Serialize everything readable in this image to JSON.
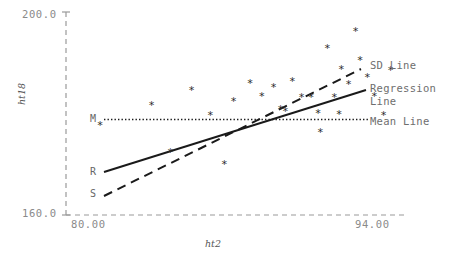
{
  "chart_data": {
    "type": "scatter",
    "title": "",
    "xlabel": "ht2",
    "ylabel": "ht18",
    "xlim": [
      80.0,
      94.0
    ],
    "ylim": [
      160.0,
      200.0
    ],
    "xticks": [
      "80.00",
      "94.00"
    ],
    "yticks": [
      "160.0",
      "200.0"
    ],
    "grid": false,
    "legend_position": "right",
    "points": [
      {
        "x": 81.2,
        "y": 177.5
      },
      {
        "x": 83.4,
        "y": 181.4
      },
      {
        "x": 84.2,
        "y": 172.3
      },
      {
        "x": 85.1,
        "y": 184.5
      },
      {
        "x": 85.9,
        "y": 179.6
      },
      {
        "x": 86.5,
        "y": 169.8
      },
      {
        "x": 86.9,
        "y": 182.2
      },
      {
        "x": 87.6,
        "y": 185.8
      },
      {
        "x": 88.1,
        "y": 183.3
      },
      {
        "x": 88.6,
        "y": 185.0
      },
      {
        "x": 88.9,
        "y": 180.6
      },
      {
        "x": 89.1,
        "y": 180.3
      },
      {
        "x": 89.4,
        "y": 186.2
      },
      {
        "x": 89.8,
        "y": 183.1
      },
      {
        "x": 90.2,
        "y": 183.0
      },
      {
        "x": 90.5,
        "y": 179.9
      },
      {
        "x": 90.6,
        "y": 176.2
      },
      {
        "x": 90.9,
        "y": 192.8
      },
      {
        "x": 91.2,
        "y": 183.0
      },
      {
        "x": 91.4,
        "y": 179.8
      },
      {
        "x": 91.5,
        "y": 188.5
      },
      {
        "x": 91.8,
        "y": 185.6
      },
      {
        "x": 92.1,
        "y": 196.0
      },
      {
        "x": 92.3,
        "y": 190.3
      },
      {
        "x": 92.6,
        "y": 186.9
      },
      {
        "x": 92.9,
        "y": 183.2
      },
      {
        "x": 93.3,
        "y": 179.6
      },
      {
        "x": 93.6,
        "y": 188.3
      }
    ],
    "lines": [
      {
        "name": "SD Line",
        "style": "dashed",
        "marker_label": "S",
        "x0": 80.9,
        "y0": 168.3,
        "x1": 93.4,
        "y1": 192.1
      },
      {
        "name": "Regression Line",
        "style": "solid",
        "marker_label": "R",
        "x0": 80.9,
        "y0": 172.9,
        "x1": 93.9,
        "y1": 189.2
      },
      {
        "name": "Mean Line",
        "style": "dotted",
        "marker_label": "M",
        "x0": 81.6,
        "y0": 183.2,
        "x1": 92.6,
        "y1": 183.2
      }
    ]
  },
  "legend": {
    "sd_line": "SD Line",
    "regression_line": "Regression Line",
    "mean_line": "Mean Line"
  },
  "markers": {
    "mean": "M",
    "regression": "R",
    "sd": "S"
  },
  "colors": {
    "axis": "#9a9a9a",
    "tick_text": "#8a8a8a",
    "data_point": "#2b2b2b",
    "line": "#1a1a1a",
    "legend_text": "#6e6e6e",
    "background": "#ffffff"
  }
}
